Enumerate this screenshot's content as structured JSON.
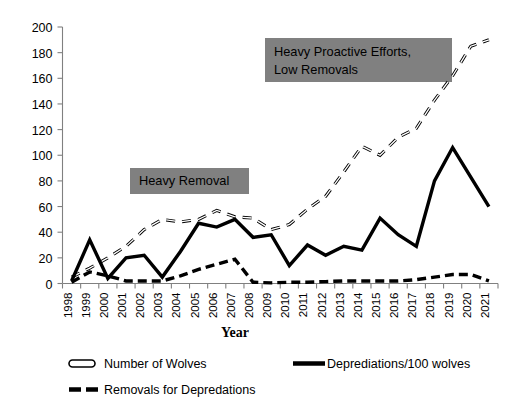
{
  "chart_data": {
    "type": "line",
    "title": "",
    "xlabel": "Year",
    "ylabel": "",
    "ylim": [
      0,
      200
    ],
    "ytick_step": 20,
    "yticks": [
      0,
      20,
      40,
      60,
      80,
      100,
      120,
      140,
      160,
      180,
      200
    ],
    "grid": false,
    "legend_position": "bottom",
    "categories": [
      "1998",
      "1999",
      "2000",
      "2001",
      "2002",
      "2003",
      "2004",
      "2005",
      "2006",
      "2007",
      "2008",
      "2009",
      "2010",
      "2011",
      "2012",
      "2013",
      "2014",
      "2015",
      "2016",
      "2017",
      "2018",
      "2019",
      "2020",
      "2021"
    ],
    "series": [
      {
        "name": "Number of  Wolves",
        "style": "long-dash-hollow",
        "values": [
          5,
          12,
          20,
          29,
          42,
          50,
          48,
          50,
          57,
          52,
          51,
          42,
          46,
          58,
          68,
          87,
          107,
          100,
          114,
          121,
          143,
          162,
          185,
          190
        ]
      },
      {
        "name": "Deprediations/100 wolves",
        "style": "solid",
        "values": [
          2,
          34,
          4,
          20,
          22,
          5,
          25,
          47,
          44,
          50,
          36,
          38,
          14,
          30,
          22,
          29,
          26,
          51,
          38,
          29,
          80,
          106,
          83,
          60
        ]
      },
      {
        "name": "Removals for Depredations",
        "style": "short-dash",
        "values": [
          1,
          9,
          6,
          2,
          2,
          2,
          6,
          11,
          15,
          19,
          1,
          0.5,
          1,
          1,
          1.5,
          2,
          2,
          2,
          2,
          3,
          5,
          7,
          7,
          2
        ]
      }
    ],
    "annotations": [
      {
        "text_line1": "Heavy Removal",
        "text_line2": ""
      },
      {
        "text_line1": "Heavy Proactive Efforts,",
        "text_line2": "Low Removals"
      }
    ],
    "annotation_box_color": "#808080",
    "line_color": "#000000"
  },
  "legend": {
    "items": [
      {
        "label": "Number of  Wolves",
        "swatch": "hollow-dash-swatch"
      },
      {
        "label": "Deprediations/100 wolves",
        "swatch": "solid-line-swatch"
      },
      {
        "label": "Removals for Depredations",
        "swatch": "dashed-line-swatch"
      }
    ]
  },
  "axis": {
    "x_title": "Year"
  }
}
